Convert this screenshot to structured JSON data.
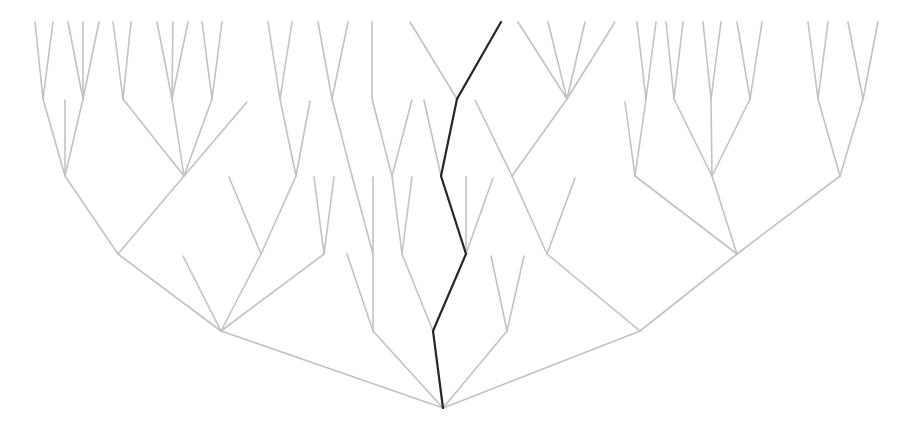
{
  "diagram": {
    "type": "tree",
    "colors": {
      "edge": "#c2c2c2",
      "highlight_path": "#262626",
      "background": "#ffffff"
    },
    "root": [
      443,
      408
    ],
    "edges": [
      [
        443,
        408,
        221,
        331
      ],
      [
        443,
        408,
        373,
        331
      ],
      [
        443,
        408,
        507,
        331
      ],
      [
        443,
        408,
        640,
        331
      ],
      [
        221,
        331,
        118,
        254
      ],
      [
        221,
        331,
        183,
        256
      ],
      [
        221,
        331,
        261,
        254
      ],
      [
        221,
        331,
        324,
        254
      ],
      [
        118,
        254,
        65,
        176
      ],
      [
        118,
        254,
        184,
        176
      ],
      [
        65,
        176,
        43,
        99
      ],
      [
        65,
        176,
        65,
        100
      ],
      [
        65,
        176,
        83,
        99
      ],
      [
        43,
        99,
        35,
        22
      ],
      [
        43,
        99,
        53,
        22
      ],
      [
        83,
        99,
        68,
        22
      ],
      [
        83,
        99,
        83,
        22
      ],
      [
        83,
        99,
        99,
        22
      ],
      [
        184,
        176,
        123,
        99
      ],
      [
        184,
        176,
        172,
        99
      ],
      [
        184,
        176,
        212,
        99
      ],
      [
        184,
        176,
        247,
        102
      ],
      [
        123,
        99,
        113,
        22
      ],
      [
        123,
        99,
        131,
        22
      ],
      [
        172,
        99,
        157,
        22
      ],
      [
        172,
        99,
        173,
        22
      ],
      [
        172,
        99,
        188,
        22
      ],
      [
        212,
        99,
        202,
        22
      ],
      [
        212,
        99,
        222,
        22
      ],
      [
        261,
        254,
        229,
        177
      ],
      [
        261,
        254,
        296,
        176
      ],
      [
        296,
        176,
        280,
        99
      ],
      [
        296,
        176,
        310,
        101
      ],
      [
        280,
        99,
        268,
        22
      ],
      [
        280,
        99,
        292,
        22
      ],
      [
        324,
        254,
        314,
        177
      ],
      [
        324,
        254,
        334,
        177
      ],
      [
        373,
        331,
        347,
        254
      ],
      [
        373,
        331,
        373,
        254
      ],
      [
        373,
        254,
        373,
        177
      ],
      [
        373,
        254,
        352,
        176
      ],
      [
        352,
        176,
        332,
        99
      ],
      [
        332,
        99,
        318,
        22
      ],
      [
        332,
        99,
        348,
        22
      ],
      [
        433,
        331,
        402,
        254
      ],
      [
        402,
        254,
        392,
        176
      ],
      [
        402,
        254,
        412,
        177
      ],
      [
        392,
        176,
        372,
        99
      ],
      [
        392,
        176,
        412,
        100
      ],
      [
        372,
        99,
        372,
        22
      ],
      [
        466,
        254,
        466,
        177
      ],
      [
        466,
        254,
        493,
        178
      ],
      [
        441,
        176,
        424,
        100
      ],
      [
        457,
        99,
        410,
        22
      ],
      [
        507,
        331,
        491,
        256
      ],
      [
        507,
        331,
        524,
        256
      ],
      [
        640,
        331,
        547,
        254
      ],
      [
        640,
        331,
        737,
        254
      ],
      [
        547,
        254,
        512,
        176
      ],
      [
        547,
        254,
        575,
        178
      ],
      [
        512,
        176,
        475,
        100
      ],
      [
        512,
        176,
        567,
        99
      ],
      [
        567,
        99,
        518,
        22
      ],
      [
        567,
        99,
        548,
        22
      ],
      [
        567,
        99,
        585,
        22
      ],
      [
        567,
        99,
        615,
        22
      ],
      [
        737,
        254,
        635,
        176
      ],
      [
        737,
        254,
        712,
        176
      ],
      [
        737,
        254,
        840,
        176
      ],
      [
        635,
        176,
        625,
        102
      ],
      [
        635,
        176,
        646,
        99
      ],
      [
        646,
        99,
        637,
        22
      ],
      [
        646,
        99,
        656,
        22
      ],
      [
        712,
        176,
        674,
        99
      ],
      [
        712,
        176,
        711,
        99
      ],
      [
        712,
        176,
        750,
        99
      ],
      [
        674,
        99,
        666,
        22
      ],
      [
        674,
        99,
        683,
        22
      ],
      [
        711,
        99,
        703,
        22
      ],
      [
        711,
        99,
        721,
        22
      ],
      [
        750,
        99,
        737,
        22
      ],
      [
        750,
        99,
        762,
        22
      ],
      [
        840,
        176,
        818,
        99
      ],
      [
        840,
        176,
        863,
        99
      ],
      [
        818,
        99,
        808,
        22
      ],
      [
        818,
        99,
        828,
        22
      ],
      [
        863,
        99,
        848,
        22
      ],
      [
        863,
        99,
        878,
        22
      ]
    ],
    "highlight_path": [
      [
        443,
        408
      ],
      [
        433,
        331
      ],
      [
        466,
        254
      ],
      [
        441,
        176
      ],
      [
        457,
        99
      ],
      [
        501,
        22
      ]
    ]
  }
}
